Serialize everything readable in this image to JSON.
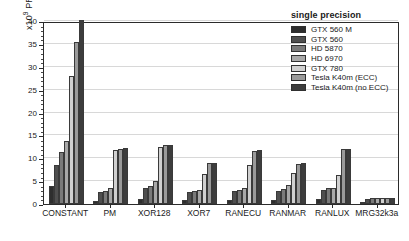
{
  "chart_data": {
    "type": "bar",
    "title": "",
    "xlabel": "",
    "ylabel": "x10⁹ PRNs/sec",
    "ylim": [
      0,
      40
    ],
    "ytick_values": [
      0,
      5,
      10,
      15,
      20,
      25,
      30,
      35,
      40
    ],
    "ytick_labels": [
      "0",
      "5",
      "10",
      "15",
      "20",
      "25",
      "30",
      "35",
      "40"
    ],
    "grid": true,
    "legend_position": "top-right",
    "legend_title": "single precision",
    "categories": [
      "CONSTANT",
      "PM",
      "XOR128",
      "XOR7",
      "RANECU",
      "RANMAR",
      "RANLUX",
      "MRG32k3a"
    ],
    "series": [
      {
        "name": "GTX 560 M",
        "color": "#2e2e2e",
        "values": [
          4.0,
          0.7,
          1.1,
          0.8,
          0.9,
          0.9,
          1.0,
          0.4
        ]
      },
      {
        "name": "GTX 560",
        "color": "#4f4f4f",
        "values": [
          8.6,
          2.6,
          3.4,
          2.6,
          2.8,
          2.9,
          3.1,
          1.2
        ]
      },
      {
        "name": "HD 5870",
        "color": "#7a7a7a",
        "values": [
          11.4,
          2.9,
          3.9,
          2.8,
          3.0,
          3.3,
          3.4,
          1.3
        ]
      },
      {
        "name": "HD 6970",
        "color": "#a8a8a8",
        "values": [
          13.7,
          3.6,
          5.1,
          3.1,
          3.6,
          4.1,
          3.5,
          1.4
        ]
      },
      {
        "name": "GTX 780",
        "color": "#d0d0d0",
        "values": [
          27.9,
          11.9,
          12.5,
          6.6,
          8.6,
          6.7,
          6.4,
          1.4
        ]
      },
      {
        "name": "Tesla K40m (ECC)",
        "color": "#9a9a9a",
        "values": [
          35.4,
          12.1,
          12.8,
          8.9,
          11.5,
          8.7,
          12.0,
          1.4
        ]
      },
      {
        "name": "Tesla K40m (no ECC)",
        "color": "#3d3d3d",
        "values": [
          40.2,
          12.3,
          13.0,
          9.0,
          11.7,
          8.9,
          12.1,
          1.4
        ]
      }
    ]
  }
}
